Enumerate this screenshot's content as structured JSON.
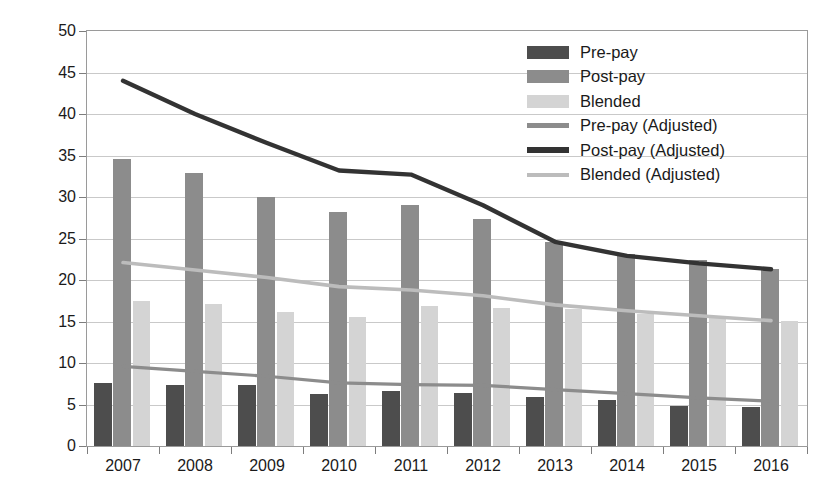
{
  "chart_data": {
    "type": "bar",
    "title": "",
    "xlabel": "",
    "ylabel": "Mobile ARPU per Subscriber (GBP)",
    "categories": [
      "2007",
      "2008",
      "2009",
      "2010",
      "2011",
      "2012",
      "2013",
      "2014",
      "2015",
      "2016"
    ],
    "ylim": [
      0,
      50
    ],
    "ytick_step": 5,
    "yticks": [
      "0",
      "5",
      "10",
      "15",
      "20",
      "25",
      "30",
      "35",
      "40",
      "45",
      "50"
    ],
    "grid": true,
    "legend_position": "top-right",
    "series": [
      {
        "name": "Pre-pay",
        "kind": "bar",
        "color": "#4d4d4d",
        "values": [
          7.6,
          7.4,
          7.3,
          6.3,
          6.6,
          6.4,
          5.9,
          5.5,
          4.8,
          4.7
        ]
      },
      {
        "name": "Post-pay",
        "kind": "bar",
        "color": "#8c8c8c",
        "values": [
          34.6,
          32.9,
          30.0,
          28.2,
          29.0,
          27.4,
          24.6,
          23.1,
          22.4,
          21.3
        ]
      },
      {
        "name": "Blended",
        "kind": "bar",
        "color": "#d4d4d4",
        "values": [
          17.5,
          17.1,
          16.1,
          15.6,
          16.9,
          16.6,
          16.5,
          15.9,
          15.7,
          15.1
        ]
      },
      {
        "name": "Pre-pay (Adjusted)",
        "kind": "line",
        "color": "#8c8c8c",
        "values": [
          9.6,
          9.0,
          8.4,
          7.6,
          7.4,
          7.3,
          6.8,
          6.3,
          5.8,
          5.4
        ]
      },
      {
        "name": "Post-pay (Adjusted)",
        "kind": "line",
        "color": "#333333",
        "values": [
          44.0,
          40.0,
          36.5,
          33.2,
          32.7,
          29.0,
          24.6,
          22.9,
          22.0,
          21.3
        ]
      },
      {
        "name": "Blended (Adjusted)",
        "kind": "line",
        "color": "#bcbcbc",
        "values": [
          22.1,
          21.2,
          20.3,
          19.2,
          18.8,
          18.1,
          17.0,
          16.3,
          15.7,
          15.1
        ]
      }
    ]
  },
  "legend": {
    "items": [
      {
        "label": "Pre-pay",
        "swatch": "bar",
        "color": "#4d4d4d"
      },
      {
        "label": "Post-pay",
        "swatch": "bar",
        "color": "#8c8c8c"
      },
      {
        "label": "Blended",
        "swatch": "bar",
        "color": "#d4d4d4"
      },
      {
        "label": "Pre-pay (Adjusted)",
        "swatch": "line",
        "color": "#8c8c8c"
      },
      {
        "label": "Post-pay (Adjusted)",
        "swatch": "line",
        "color": "#333333"
      },
      {
        "label": "Blended (Adjusted)",
        "swatch": "line",
        "color": "#bcbcbc"
      }
    ]
  },
  "axes": {
    "y_title": "Mobile ARPU per Subscriber (GBP)"
  }
}
